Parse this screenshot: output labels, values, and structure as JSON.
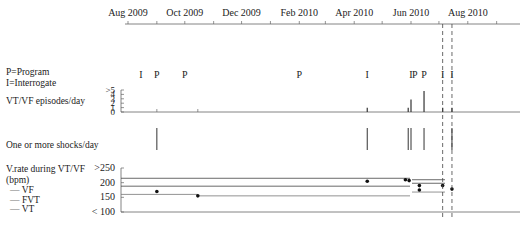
{
  "chart_data": {
    "type": "timeline",
    "title": "",
    "time_axis": {
      "tick_labels": [
        "Aug 2009",
        "Oct 2009",
        "Dec 2009",
        "Feb 2010",
        "Apr 2010",
        "Jun 2010",
        "Aug 2010"
      ],
      "range": [
        "Jul 2009",
        "Sep 2010"
      ]
    },
    "legend": {
      "program": "P=Program",
      "interrogate": "I=Interrogate"
    },
    "device_events": [
      {
        "date": "2009-08-15",
        "type": "I"
      },
      {
        "date": "2009-09-01",
        "type": "P"
      },
      {
        "date": "2009-10-01",
        "type": "P"
      },
      {
        "date": "2010-02-01",
        "type": "P"
      },
      {
        "date": "2010-04-15",
        "type": "I"
      },
      {
        "date": "2010-06-01",
        "type": "I"
      },
      {
        "date": "2010-06-05",
        "type": "P"
      },
      {
        "date": "2010-06-15",
        "type": "P"
      },
      {
        "date": "2010-07-05",
        "type": "I"
      },
      {
        "date": "2010-07-15",
        "type": "I"
      }
    ],
    "panels": [
      {
        "name": "VT/VF episodes/day",
        "type": "bar",
        "y_tick_labels": [
          "0",
          "1",
          "2",
          "3",
          "4",
          ">5"
        ],
        "ylim": [
          0,
          5
        ],
        "values": [
          {
            "date": "2010-04-15",
            "value": 1
          },
          {
            "date": "2010-05-29",
            "value": 1
          },
          {
            "date": "2010-06-01",
            "value": 3
          },
          {
            "date": "2010-06-15",
            "value": 5
          },
          {
            "date": "2010-07-05",
            "value": 1
          },
          {
            "date": "2010-07-15",
            "value": 1
          }
        ]
      },
      {
        "name": "One or more shocks/day",
        "type": "event",
        "dates": [
          "2009-09-01",
          "2010-04-15",
          "2010-05-29",
          "2010-06-01",
          "2010-06-15",
          "2010-07-15"
        ]
      },
      {
        "name": "V.rate during VT/VF (bpm)",
        "type": "scatter",
        "y_tick_labels": [
          "< 100",
          "150",
          "200",
          ">250"
        ],
        "ylim": [
          100,
          250
        ],
        "zone_labels": [
          "VF",
          "FVT",
          "VT"
        ],
        "points": [
          {
            "date": "2009-09-01",
            "value": 170
          },
          {
            "date": "2009-10-15",
            "value": 155
          },
          {
            "date": "2010-04-15",
            "value": 205
          },
          {
            "date": "2010-05-26",
            "value": 210
          },
          {
            "date": "2010-05-30",
            "value": 207
          },
          {
            "date": "2010-06-10",
            "value": 190
          },
          {
            "date": "2010-06-10",
            "value": 175
          },
          {
            "date": "2010-07-05",
            "value": 190
          },
          {
            "date": "2010-07-15",
            "value": 178
          }
        ]
      }
    ],
    "grid": false
  },
  "labels": {
    "program_legend": "P=Program",
    "interrogate_legend": "I=Interrogate",
    "episodes_panel": "VT/VF episodes/day",
    "shocks_panel": "One or more shocks/day",
    "rate_panel_line1": "V.rate during VT/VF",
    "rate_panel_line2": "(bpm)",
    "zone_vf": "VF",
    "zone_fvt": "FVT",
    "zone_vt": "VT"
  }
}
